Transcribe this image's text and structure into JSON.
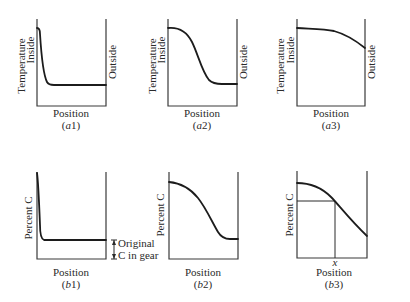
{
  "figure": {
    "panels": [
      {
        "id": "a1",
        "caption_letter": "a",
        "caption_number": "1",
        "ylabel": "Temperature",
        "inside_label": "Inside",
        "outside_label": "Outside",
        "xlabel": "Position"
      },
      {
        "id": "a2",
        "caption_letter": "a",
        "caption_number": "2",
        "ylabel": "Temperature",
        "inside_label": "Inside",
        "outside_label": "Outside",
        "xlabel": "Position"
      },
      {
        "id": "a3",
        "caption_letter": "a",
        "caption_number": "3",
        "ylabel": "Temperature",
        "inside_label": "Inside",
        "outside_label": "Outside",
        "xlabel": "Position"
      },
      {
        "id": "b1",
        "caption_letter": "b",
        "caption_number": "1",
        "ylabel": "Percent C",
        "xlabel": "Position",
        "annotation_line1": "Original",
        "annotation_line2": "C in gear"
      },
      {
        "id": "b2",
        "caption_letter": "b",
        "caption_number": "2",
        "ylabel": "Percent C",
        "xlabel": "Position"
      },
      {
        "id": "b3",
        "caption_letter": "b",
        "caption_number": "3",
        "ylabel": "Percent C",
        "xlabel": "Position",
        "x_marker": "x"
      }
    ],
    "paren_open": "(",
    "paren_close": ")"
  }
}
